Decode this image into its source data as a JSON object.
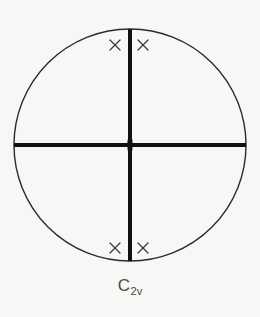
{
  "figure": {
    "kind": "stereographic-projection",
    "background_color": "#f8f7f6",
    "circle": {
      "center_x": 130,
      "center_y": 145,
      "radius": 116,
      "stroke_color": "#2b2b2b",
      "stroke_width": 1.4,
      "fill": "none"
    },
    "mirror_lines": [
      {
        "name": "vertical-mirror-line",
        "orientation": "vertical",
        "x1": 130,
        "y1": 29,
        "x2": 130,
        "y2": 261,
        "stroke_color": "#111111",
        "stroke_width": 4
      },
      {
        "name": "horizontal-mirror-line",
        "orientation": "horizontal",
        "x1": 14,
        "y1": 145,
        "x2": 246,
        "y2": 145,
        "stroke_color": "#111111",
        "stroke_width": 4
      }
    ],
    "rotation_axis": {
      "name": "two-fold-rotation-axis",
      "symbol": "lens",
      "order": 2,
      "center_x": 130,
      "center_y": 145,
      "half_width": 5,
      "half_height": 11,
      "fill_color": "#111111"
    },
    "points": [
      {
        "label": "x",
        "x": 115,
        "y": 45,
        "quadrant": "upper-left"
      },
      {
        "label": "x",
        "x": 143,
        "y": 45,
        "quadrant": "upper-right"
      },
      {
        "label": "x",
        "x": 115,
        "y": 248,
        "quadrant": "lower-left"
      },
      {
        "label": "x",
        "x": 143,
        "y": 248,
        "quadrant": "lower-right"
      }
    ],
    "point_style": {
      "stroke_color": "#3a3a3a",
      "stroke_width": 1.3,
      "arm_length": 5
    }
  },
  "caption": {
    "full_text": "C2v",
    "main": "C",
    "subscript": "2v"
  }
}
